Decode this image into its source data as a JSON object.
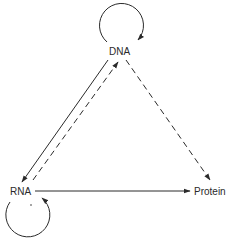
{
  "diagram": {
    "title": "",
    "nodes": [
      {
        "id": "dna",
        "label": "DNA"
      },
      {
        "id": "rna",
        "label": "RNA"
      },
      {
        "id": "protein",
        "label": "Protein"
      }
    ],
    "edges": [
      {
        "from": "dna",
        "to": "dna",
        "style": "solid",
        "kind": "self-loop"
      },
      {
        "from": "rna",
        "to": "rna",
        "style": "solid",
        "kind": "self-loop",
        "marker": "*"
      },
      {
        "from": "dna",
        "to": "rna",
        "style": "solid"
      },
      {
        "from": "rna",
        "to": "dna",
        "style": "dashed"
      },
      {
        "from": "dna",
        "to": "protein",
        "style": "dashed"
      },
      {
        "from": "rna",
        "to": "protein",
        "style": "solid"
      }
    ],
    "colors": {
      "line": "#2a2a2a",
      "background": "#ffffff"
    }
  }
}
